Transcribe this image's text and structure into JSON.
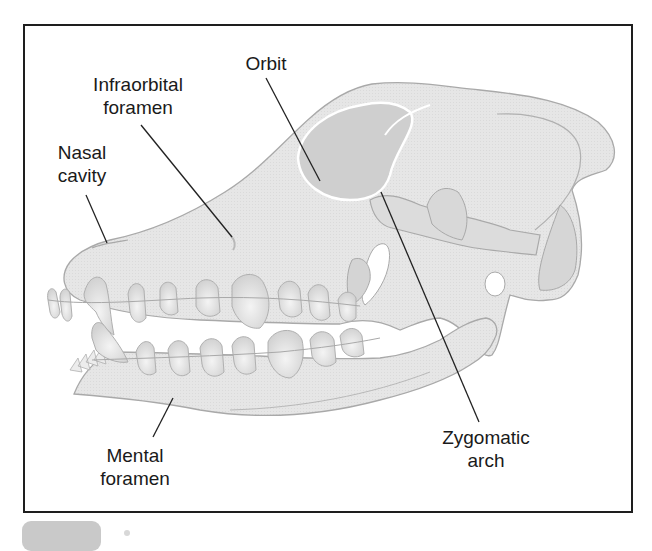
{
  "figure": {
    "colors": {
      "frame": "#1e1e1e",
      "bone_fill": "#e4e4e4",
      "bone_outline": "#a9a9a9",
      "orbit_fill": "#cfcfcf",
      "leader_line": "#222222",
      "badge": "#c9c9c9"
    }
  },
  "labels": {
    "orbit": {
      "lines": [
        "Orbit"
      ]
    },
    "infraorbital_foramen": {
      "lines": [
        "Infraorbital",
        "foramen"
      ]
    },
    "nasal_cavity": {
      "lines": [
        "Nasal",
        "cavity"
      ]
    },
    "mental_foramen": {
      "lines": [
        "Mental",
        "foramen"
      ]
    },
    "zygomatic_arch": {
      "lines": [
        "Zygomatic",
        "arch"
      ]
    }
  }
}
